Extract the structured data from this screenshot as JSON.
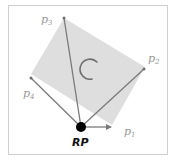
{
  "diagram": {
    "reference_point_label": "RP",
    "points": [
      {
        "name": "p",
        "sub": "1"
      },
      {
        "name": "p",
        "sub": "2"
      },
      {
        "name": "p",
        "sub": "3"
      },
      {
        "name": "p",
        "sub": "4"
      }
    ],
    "colors": {
      "rectangle_fill": "#dcdcdc",
      "vector": "#7a7a7a",
      "label": "#9a9a9a",
      "reference_point": "#000000",
      "frame": "#cfcfcf",
      "rotation_arc": "#6e6e6e"
    }
  }
}
